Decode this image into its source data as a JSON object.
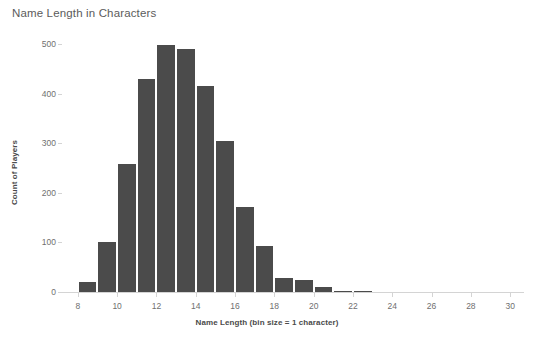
{
  "title": "Name Length in Characters",
  "chart_data": {
    "type": "bar",
    "title": "Name Length in Characters",
    "xlabel": "Name Length (bin size = 1 character)",
    "ylabel": "Count of Players",
    "categories": [
      8,
      9,
      10,
      11,
      12,
      13,
      14,
      15,
      16,
      17,
      18,
      19,
      20,
      21,
      22
    ],
    "values": [
      20,
      100,
      258,
      430,
      498,
      490,
      415,
      305,
      171,
      93,
      29,
      25,
      10,
      3,
      1
    ],
    "xlim": [
      7.5,
      30.5
    ],
    "ylim": [
      0,
      500
    ],
    "xticks": [
      8,
      10,
      12,
      14,
      16,
      18,
      20,
      22,
      24,
      26,
      28,
      30
    ],
    "yticks": [
      0,
      100,
      200,
      300,
      400,
      500
    ],
    "grid": false,
    "legend": "none",
    "bar_color": "#4b4b4b",
    "axis_color": "#d4d4d4",
    "text_color": "#6f6f6f"
  }
}
